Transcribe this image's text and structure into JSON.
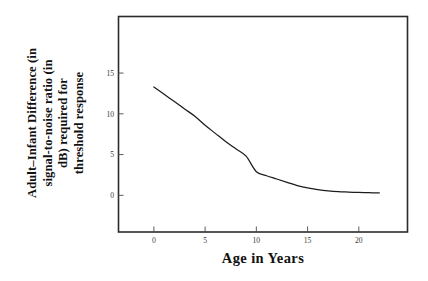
{
  "figure": {
    "background_color": "#ffffff",
    "frame_color": "#2b2b2b",
    "curve_color": "#1c1c1c",
    "tick_label_color": "#3a3a3a",
    "title_color": "#111111"
  },
  "ylabel": {
    "line1": "Adult–Infant Difference (in",
    "line2": "signal-to-noise ratio (in",
    "line3": "dB) required for",
    "line4": "threshold response",
    "full": "Adult–Infant Difference in signal-to-noise ratio (in dB) required for threshold response"
  },
  "xlabel": {
    "text": "Age in Years"
  },
  "chart_data": {
    "type": "line",
    "title": "",
    "subtitle": "",
    "xlabel": "Age in Years",
    "ylabel": "Adult–Infant Difference in signal-to-noise ratio (in dB) required for threshold response",
    "xlim": [
      -3.5,
      24.8
    ],
    "ylim": [
      -4.5,
      22.0
    ],
    "xticks": [
      0,
      5,
      10,
      15,
      20
    ],
    "xticklabels": [
      "0",
      "5",
      "10",
      "15",
      "20"
    ],
    "yticks": [
      0,
      5,
      10,
      15
    ],
    "yticklabels": [
      "0",
      "5",
      "10",
      "15"
    ],
    "grid": false,
    "legend": false,
    "legend_position": "none",
    "series": [
      {
        "name": "Adult-infant difference",
        "x": [
          0,
          1,
          2,
          3,
          4,
          5,
          6,
          7,
          8,
          9,
          10,
          11,
          12,
          13,
          14,
          15,
          16,
          17,
          18,
          19,
          20,
          21,
          22
        ],
        "y": [
          13.3,
          12.4,
          11.5,
          10.6,
          9.7,
          8.6,
          7.6,
          6.6,
          5.7,
          4.8,
          2.9,
          2.4,
          2.0,
          1.6,
          1.2,
          0.9,
          0.7,
          0.55,
          0.45,
          0.4,
          0.35,
          0.32,
          0.3
        ]
      }
    ],
    "annotations": []
  }
}
